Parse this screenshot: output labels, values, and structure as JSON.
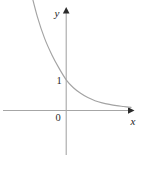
{
  "figure": {
    "kind": "cartesian-plot",
    "background_color": "#ffffff",
    "axis_color": "#a6a6a6",
    "curve_color": "#a3a3a3",
    "label_color": "#1c1c1c",
    "x_axis_label": "x",
    "y_axis_label": "y",
    "origin_label": "0",
    "y_intercept_label": "1",
    "caption_text": ""
  },
  "chart_data": {
    "type": "line",
    "title": "",
    "subtitle": "",
    "xlabel": "x",
    "ylabel": "y",
    "grid": false,
    "legend": null,
    "legend_position": "none",
    "axis_style": "arrowed-cartesian",
    "x_axis_arrow": true,
    "y_axis_arrow": true,
    "xlim": [
      -3.4,
      5.2
    ],
    "ylim": [
      -1.8,
      4.2
    ],
    "xticks": [
      0
    ],
    "xtick_labels": [
      "0"
    ],
    "yticks": [
      1
    ],
    "ytick_labels": [
      "1"
    ],
    "annotations": [
      {
        "text": "1",
        "x": -0.28,
        "y": 1.0,
        "note": "y-intercept tick label, left of y-axis"
      },
      {
        "text": "0",
        "x": -0.28,
        "y": -0.22,
        "note": "origin label, below-left of origin"
      },
      {
        "text": "y",
        "x": -0.28,
        "y": 4.05,
        "note": "y-axis name, left of axis arrow"
      },
      {
        "text": "x",
        "x": 5.05,
        "y": -0.35,
        "note": "x-axis name, below axis arrow"
      }
    ],
    "series": [
      {
        "name": "y = a^x (0 < a < 1)",
        "equation": "y = a^x, 0 < a < 1",
        "description": "decreasing exponential, passes through (0, 1), asymptotic to the positive x-axis",
        "x": [
          -2.5,
          -2.0,
          -1.5,
          -1.0,
          -0.5,
          0.0,
          0.5,
          1.0,
          1.5,
          2.0,
          2.5,
          3.0,
          3.5,
          4.0,
          4.5
        ],
        "y": [
          3.95,
          3.05,
          2.35,
          1.82,
          1.38,
          1.0,
          0.74,
          0.56,
          0.42,
          0.32,
          0.25,
          0.2,
          0.16,
          0.13,
          0.1
        ]
      }
    ]
  }
}
